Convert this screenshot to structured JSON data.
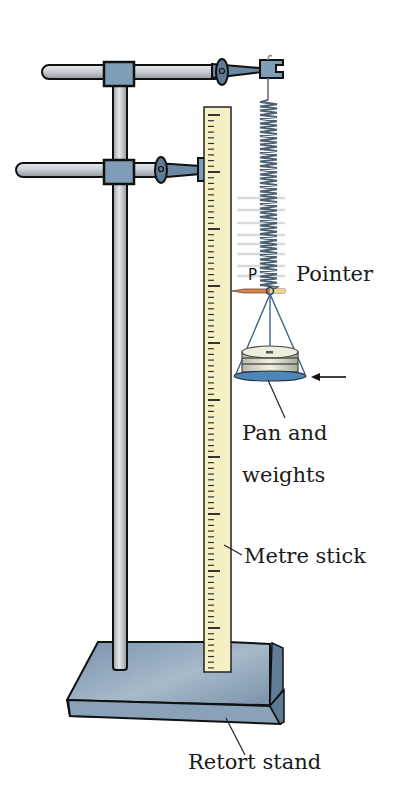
{
  "diagram": {
    "labels": {
      "pointer_letter": "P",
      "pointer": "Pointer",
      "pan_line1": "Pan and",
      "pan_line2": "weights",
      "metre_stick": "Metre stick",
      "retort_stand": "Retort stand"
    },
    "colors": {
      "steel_blue": "#7f9cb8",
      "clamp_dark": "#5e7b93",
      "rod_light": "#d9dde2",
      "rod_mid": "#aeb6bf",
      "ruler_fill": "#f6f1c4",
      "pan_blue": "#4f86b8",
      "pointer_orange": "#d9824a",
      "outline": "#111111",
      "base_top": "#8aa3ba",
      "base_side": "#6f8aa3"
    },
    "components": [
      {
        "name": "retort-stand",
        "label": "Retort stand"
      },
      {
        "name": "metre-stick",
        "label": "Metre stick"
      },
      {
        "name": "spring",
        "label": ""
      },
      {
        "name": "pointer",
        "label": "Pointer"
      },
      {
        "name": "pan-and-weights",
        "label": "Pan and weights"
      }
    ]
  }
}
